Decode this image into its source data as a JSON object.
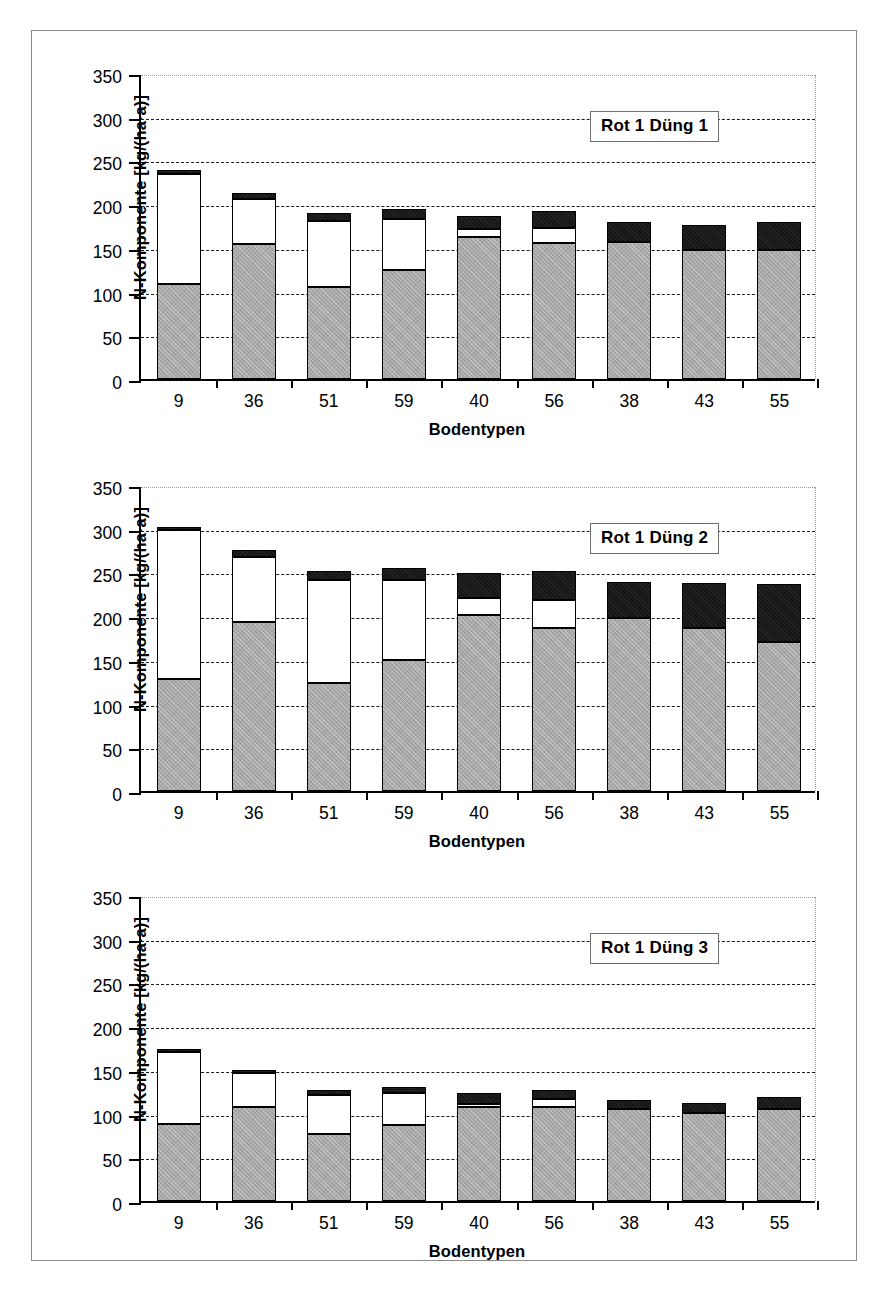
{
  "figure": {
    "background_color": "#ffffff",
    "border_color": "#8a8a8a"
  },
  "axis": {
    "y_title": "N-Komponente [kg/(ha·a)]",
    "x_title": "Bodentypen",
    "y_ticks": [
      "350",
      "300",
      "250",
      "200",
      "150",
      "100",
      "50",
      "0"
    ]
  },
  "colors": {
    "segment_bottom": "#a8a8a8",
    "segment_middle": "#ffffff",
    "segment_top": "#161616",
    "grid": "#1a1a1a",
    "axis": "#000000"
  },
  "panels": [
    {
      "label": "Rot 1 Düng 1"
    },
    {
      "label": "Rot 1 Düng 2"
    },
    {
      "label": "Rot 1 Düng 3"
    }
  ],
  "chart_data": [
    {
      "type": "bar",
      "stacked": true,
      "title": "Rot 1 Düng 1",
      "xlabel": "Bodentypen",
      "ylabel": "N-Komponente [kg/(ha·a)]",
      "ylim": [
        0,
        350
      ],
      "yticks": [
        0,
        50,
        100,
        150,
        200,
        250,
        300,
        350
      ],
      "grid": true,
      "legend_position": "inside-top-right",
      "categories": [
        "9",
        "36",
        "51",
        "59",
        "40",
        "56",
        "38",
        "43",
        "55"
      ],
      "series": [
        {
          "name": "segment-bottom-gray",
          "values": [
            109,
            155,
            105,
            125,
            162,
            156,
            157,
            148,
            147
          ]
        },
        {
          "name": "segment-middle-white",
          "values": [
            126,
            51,
            76,
            58,
            10,
            17,
            0,
            0,
            0
          ]
        },
        {
          "name": "segment-top-black",
          "values": [
            4,
            7,
            9,
            11,
            15,
            19,
            23,
            28,
            33
          ]
        }
      ],
      "totals": [
        239,
        213,
        190,
        194,
        187,
        192,
        180,
        176,
        180
      ]
    },
    {
      "type": "bar",
      "stacked": true,
      "title": "Rot 1 Düng 2",
      "xlabel": "Bodentypen",
      "ylabel": "N-Komponente [kg/(ha·a)]",
      "ylim": [
        0,
        350
      ],
      "yticks": [
        0,
        50,
        100,
        150,
        200,
        250,
        300,
        350
      ],
      "grid": true,
      "legend_position": "inside-top-right",
      "categories": [
        "9",
        "36",
        "51",
        "59",
        "40",
        "56",
        "38",
        "43",
        "55"
      ],
      "series": [
        {
          "name": "segment-bottom-gray",
          "values": [
            128,
            193,
            123,
            150,
            201,
            187,
            198,
            186,
            171
          ]
        },
        {
          "name": "segment-middle-white",
          "values": [
            170,
            75,
            118,
            91,
            20,
            32,
            0,
            0,
            0
          ]
        },
        {
          "name": "segment-top-black",
          "values": [
            4,
            8,
            11,
            14,
            28,
            33,
            41,
            52,
            66
          ]
        }
      ],
      "totals": [
        302,
        276,
        252,
        255,
        249,
        252,
        239,
        238,
        237
      ]
    },
    {
      "type": "bar",
      "stacked": true,
      "title": "Rot 1 Düng 3",
      "xlabel": "Bodentypen",
      "ylabel": "N-Komponente [kg/(ha·a)]",
      "ylim": [
        0,
        350
      ],
      "yticks": [
        0,
        50,
        100,
        150,
        200,
        250,
        300,
        350
      ],
      "grid": true,
      "legend_position": "inside-top-right",
      "categories": [
        "9",
        "36",
        "51",
        "59",
        "40",
        "56",
        "38",
        "43",
        "55"
      ],
      "series": [
        {
          "name": "segment-bottom-gray",
          "values": [
            88,
            108,
            77,
            87,
            107,
            107,
            105,
            101,
            105
          ]
        },
        {
          "name": "segment-middle-white",
          "values": [
            83,
            38,
            44,
            37,
            4,
            10,
            0,
            0,
            0
          ]
        },
        {
          "name": "segment-top-black",
          "values": [
            3,
            4,
            6,
            6,
            13,
            10,
            11,
            11,
            14
          ]
        }
      ],
      "totals": [
        174,
        150,
        127,
        130,
        124,
        127,
        116,
        112,
        119
      ]
    }
  ]
}
